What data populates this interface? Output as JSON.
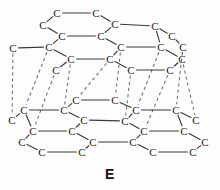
{
  "figure": {
    "caption": "E",
    "atom_symbol": "C",
    "colors": {
      "background": "#fdfdfd",
      "bond": "#3a3a3a",
      "interlayer_bond": "#6e6e6e",
      "atom_text": "#1a1a1a",
      "caption_text": "#111111"
    },
    "diagram": {
      "type": "ball-and-stick-lattice",
      "layers": 2,
      "layer_names": [
        "upper-sheet",
        "lower-sheet"
      ],
      "atoms": [
        {
          "id": "u1",
          "x": 57,
          "y": 13,
          "label": "C",
          "layer": "upper-sheet"
        },
        {
          "id": "u2",
          "x": 96,
          "y": 13,
          "label": "C",
          "layer": "upper-sheet"
        },
        {
          "id": "u3",
          "x": 43,
          "y": 25,
          "label": "C",
          "layer": "upper-sheet"
        },
        {
          "id": "u4",
          "x": 115,
          "y": 24,
          "label": "C",
          "layer": "upper-sheet"
        },
        {
          "id": "u5",
          "x": 155,
          "y": 26,
          "label": "C",
          "layer": "upper-sheet"
        },
        {
          "id": "u6",
          "x": 62,
          "y": 36,
          "label": "C",
          "layer": "upper-sheet"
        },
        {
          "id": "u7",
          "x": 101,
          "y": 36,
          "label": "C",
          "layer": "upper-sheet"
        },
        {
          "id": "u8",
          "x": 172,
          "y": 36,
          "label": "C",
          "layer": "upper-sheet"
        },
        {
          "id": "u9",
          "x": 13,
          "y": 48,
          "label": "C",
          "layer": "upper-sheet"
        },
        {
          "id": "u10",
          "x": 49,
          "y": 47,
          "label": "C",
          "layer": "upper-sheet"
        },
        {
          "id": "u11",
          "x": 121,
          "y": 47,
          "label": "C",
          "layer": "upper-sheet"
        },
        {
          "id": "u12",
          "x": 161,
          "y": 47,
          "label": "C",
          "layer": "upper-sheet"
        },
        {
          "id": "u13",
          "x": 183,
          "y": 47,
          "label": "C",
          "layer": "upper-sheet"
        },
        {
          "id": "u14",
          "x": 71,
          "y": 59,
          "label": "C",
          "layer": "upper-sheet"
        },
        {
          "id": "u15",
          "x": 110,
          "y": 59,
          "label": "C",
          "layer": "upper-sheet"
        },
        {
          "id": "u16",
          "x": 182,
          "y": 59,
          "label": "C",
          "layer": "upper-sheet"
        },
        {
          "id": "u17",
          "x": 56,
          "y": 70,
          "label": "C",
          "layer": "upper-sheet"
        },
        {
          "id": "u18",
          "x": 131,
          "y": 70,
          "label": "C",
          "layer": "upper-sheet"
        },
        {
          "id": "u19",
          "x": 170,
          "y": 70,
          "label": "C",
          "layer": "upper-sheet"
        },
        {
          "id": "l1",
          "x": 76,
          "y": 100,
          "label": "C",
          "layer": "lower-sheet"
        },
        {
          "id": "l2",
          "x": 115,
          "y": 100,
          "label": "C",
          "layer": "lower-sheet"
        },
        {
          "id": "l3",
          "x": 24,
          "y": 110,
          "label": "C",
          "layer": "lower-sheet"
        },
        {
          "id": "l4",
          "x": 64,
          "y": 110,
          "label": "C",
          "layer": "lower-sheet"
        },
        {
          "id": "l5",
          "x": 136,
          "y": 110,
          "label": "C",
          "layer": "lower-sheet"
        },
        {
          "id": "l6",
          "x": 176,
          "y": 110,
          "label": "C",
          "layer": "lower-sheet"
        },
        {
          "id": "l7",
          "x": 12,
          "y": 120,
          "label": "C",
          "layer": "lower-sheet"
        },
        {
          "id": "l8",
          "x": 84,
          "y": 120,
          "label": "C",
          "layer": "lower-sheet"
        },
        {
          "id": "l9",
          "x": 125,
          "y": 121,
          "label": "C",
          "layer": "lower-sheet"
        },
        {
          "id": "l10",
          "x": 196,
          "y": 120,
          "label": "C",
          "layer": "lower-sheet"
        },
        {
          "id": "l11",
          "x": 33,
          "y": 131,
          "label": "C",
          "layer": "lower-sheet"
        },
        {
          "id": "l12",
          "x": 72,
          "y": 131,
          "label": "C",
          "layer": "lower-sheet"
        },
        {
          "id": "l13",
          "x": 144,
          "y": 131,
          "label": "C",
          "layer": "lower-sheet"
        },
        {
          "id": "l14",
          "x": 184,
          "y": 131,
          "label": "C",
          "layer": "lower-sheet"
        },
        {
          "id": "l15",
          "x": 22,
          "y": 142,
          "label": "C",
          "layer": "lower-sheet"
        },
        {
          "id": "l16",
          "x": 93,
          "y": 142,
          "label": "C",
          "layer": "lower-sheet"
        },
        {
          "id": "l17",
          "x": 133,
          "y": 142,
          "label": "C",
          "layer": "lower-sheet"
        },
        {
          "id": "l18",
          "x": 205,
          "y": 142,
          "label": "C",
          "layer": "lower-sheet"
        },
        {
          "id": "l19",
          "x": 42,
          "y": 152,
          "label": "C",
          "layer": "lower-sheet"
        },
        {
          "id": "l20",
          "x": 82,
          "y": 152,
          "label": "C",
          "layer": "lower-sheet"
        },
        {
          "id": "l21",
          "x": 153,
          "y": 152,
          "label": "C",
          "layer": "lower-sheet"
        },
        {
          "id": "l22",
          "x": 193,
          "y": 152,
          "label": "C",
          "layer": "lower-sheet"
        }
      ],
      "bonds": [
        [
          "u1",
          "u2"
        ],
        [
          "u1",
          "u3"
        ],
        [
          "u2",
          "u4"
        ],
        [
          "u3",
          "u6"
        ],
        [
          "u4",
          "u5"
        ],
        [
          "u4",
          "u7"
        ],
        [
          "u5",
          "u8"
        ],
        [
          "u6",
          "u7"
        ],
        [
          "u6",
          "u10"
        ],
        [
          "u7",
          "u11"
        ],
        [
          "u8",
          "u13"
        ],
        [
          "u5",
          "u12"
        ],
        [
          "u9",
          "u10"
        ],
        [
          "u10",
          "u14"
        ],
        [
          "u11",
          "u12"
        ],
        [
          "u11",
          "u15"
        ],
        [
          "u12",
          "u16"
        ],
        [
          "u13",
          "u16"
        ],
        [
          "u14",
          "u15"
        ],
        [
          "u14",
          "u17"
        ],
        [
          "u15",
          "u18"
        ],
        [
          "u16",
          "u19"
        ],
        [
          "u18",
          "u19"
        ],
        [
          "l1",
          "l2"
        ],
        [
          "l1",
          "l4"
        ],
        [
          "l2",
          "l5"
        ],
        [
          "l3",
          "l4"
        ],
        [
          "l4",
          "l8"
        ],
        [
          "l5",
          "l6"
        ],
        [
          "l5",
          "l9"
        ],
        [
          "l6",
          "l10"
        ],
        [
          "l3",
          "l7"
        ],
        [
          "l3",
          "l11"
        ],
        [
          "l8",
          "l9"
        ],
        [
          "l8",
          "l12"
        ],
        [
          "l9",
          "l13"
        ],
        [
          "l6",
          "l14"
        ],
        [
          "l11",
          "l12"
        ],
        [
          "l11",
          "l15"
        ],
        [
          "l12",
          "l16"
        ],
        [
          "l13",
          "l14"
        ],
        [
          "l13",
          "l17"
        ],
        [
          "l14",
          "l18"
        ],
        [
          "l15",
          "l19"
        ],
        [
          "l16",
          "l17"
        ],
        [
          "l16",
          "l20"
        ],
        [
          "l17",
          "l21"
        ],
        [
          "l18",
          "l22"
        ],
        [
          "l19",
          "l20"
        ],
        [
          "l21",
          "l22"
        ]
      ],
      "interlayer_bonds": [
        [
          "u9",
          "l7"
        ],
        [
          "u10",
          "l3"
        ],
        [
          "u14",
          "l4"
        ],
        [
          "u17",
          "l11"
        ],
        [
          "u15",
          "l1"
        ],
        [
          "u11",
          "l2"
        ],
        [
          "u18",
          "l9"
        ],
        [
          "u19",
          "l13"
        ],
        [
          "u12",
          "l5"
        ],
        [
          "u13",
          "l6"
        ],
        [
          "u16",
          "l10"
        ]
      ]
    }
  }
}
